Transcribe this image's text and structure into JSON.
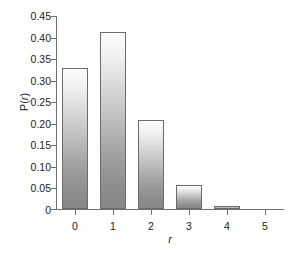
{
  "chart_data": {
    "type": "bar",
    "title": "",
    "subtitle": "",
    "xlabel": "r",
    "ylabel": "P(r)",
    "categories": [
      "0",
      "1",
      "2",
      "3",
      "4",
      "5"
    ],
    "values": [
      0.328,
      0.412,
      0.207,
      0.055,
      0.008,
      0.0
    ],
    "ylim": [
      0,
      0.45
    ],
    "xlim": [
      -0.5,
      5.5
    ],
    "ytick_labels": [
      "0.45",
      "0.40",
      "0.35",
      "0.30",
      "0.25",
      "0.20",
      "0.15",
      "0.10",
      "0.05",
      "0"
    ],
    "ytick_values": [
      0.45,
      0.4,
      0.35,
      0.3,
      0.25,
      0.2,
      0.15,
      0.1,
      0.05,
      0
    ],
    "grid": false,
    "legend": null,
    "legend_position": "none",
    "annotations": [],
    "colors": {
      "bar_top": "#fdfdfd",
      "bar_bottom": "#878787",
      "bar_edge": "#6b6b6b",
      "axis": "#707070",
      "text": "#1d1d1d",
      "background": "#ffffff"
    }
  }
}
